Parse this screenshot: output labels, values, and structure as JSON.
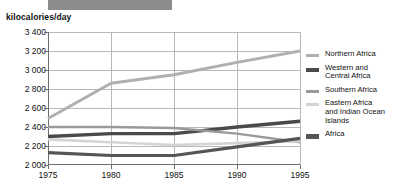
{
  "header": {
    "bar_color": "#8c8c8c",
    "axis_unit_label": "kilocalories/day"
  },
  "chart_data": {
    "type": "line",
    "title": "",
    "xlabel": "",
    "ylabel": "kilocalories/day",
    "x": [
      1975,
      1980,
      1985,
      1990,
      1995
    ],
    "xtick_labels": [
      "1975",
      "1980",
      "1985",
      "1990",
      "1995"
    ],
    "ytick_labels": [
      "2 000",
      "2 200",
      "2 400",
      "2 600",
      "2 800",
      "3 000",
      "3 200",
      "3 400"
    ],
    "yticks": [
      2000,
      2200,
      2400,
      2600,
      2800,
      3000,
      3200,
      3400
    ],
    "ylim": [
      2000,
      3400
    ],
    "xlim": [
      1975,
      1995
    ],
    "grid": true,
    "legend_position": "right",
    "series": [
      {
        "name": "Northern Africa",
        "color": "#b0b0b0",
        "width": 3.0,
        "values": [
          2490,
          2860,
          2950,
          3080,
          3200
        ]
      },
      {
        "name": "Western and Central Africa",
        "color": "#4a4a4a",
        "width": 3.4,
        "values": [
          2300,
          2330,
          2330,
          2400,
          2460
        ]
      },
      {
        "name": "Southern Africa",
        "color": "#9a9a9a",
        "width": 2.4,
        "values": [
          2400,
          2400,
          2390,
          2330,
          2240
        ]
      },
      {
        "name": "Eastern Africa and Indian Ocean Islands",
        "color": "#d4d4d4",
        "width": 2.6,
        "values": [
          2270,
          2240,
          2210,
          2230,
          2250
        ]
      },
      {
        "name": "Africa",
        "color": "#555555",
        "width": 3.2,
        "values": [
          2130,
          2100,
          2100,
          2190,
          2280
        ]
      }
    ]
  },
  "legend": {
    "items": [
      {
        "label": "Northern Africa",
        "color": "#b0b0b0",
        "thickness": 3
      },
      {
        "label": "Western and\nCentral Africa",
        "color": "#4a4a4a",
        "thickness": 4
      },
      {
        "label": "Southern Africa",
        "color": "#9a9a9a",
        "thickness": 3
      },
      {
        "label": "Eastern Africa\nand Indian Ocean\nIslands",
        "color": "#d4d4d4",
        "thickness": 3
      },
      {
        "label": "Africa",
        "color": "#555555",
        "thickness": 5
      }
    ]
  }
}
